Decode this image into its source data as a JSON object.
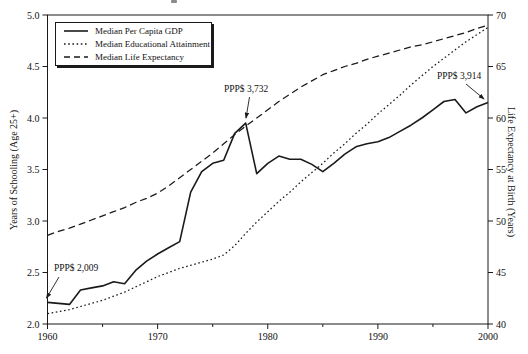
{
  "chart_data": {
    "type": "line",
    "title": "",
    "x": [
      1960,
      1961,
      1962,
      1963,
      1964,
      1965,
      1966,
      1967,
      1968,
      1969,
      1970,
      1971,
      1972,
      1973,
      1974,
      1975,
      1976,
      1977,
      1978,
      1979,
      1980,
      1981,
      1982,
      1983,
      1984,
      1985,
      1986,
      1987,
      1988,
      1989,
      1990,
      1991,
      1992,
      1993,
      1994,
      1995,
      1996,
      1997,
      1998,
      1999,
      2000
    ],
    "xlim": [
      1960,
      2000
    ],
    "ylim_left": [
      2.0,
      5.0
    ],
    "ylim_right": [
      40,
      70
    ],
    "ylabel_left": "Years of Schooling (Age 25+)",
    "ylabel_right": "Life Expectancy at Birth (Years)",
    "xlabel": "",
    "grid": false,
    "legend_position": "top-left",
    "xticks_major": [
      1960,
      1970,
      1980,
      1990,
      2000
    ],
    "xticks_minor": [
      1965,
      1975,
      1985,
      1995
    ],
    "yticks_left": [
      "2.0",
      "2.5",
      "3.0",
      "3.5",
      "4.0",
      "4.5",
      "5.0"
    ],
    "yticks_right": [
      "40",
      "45",
      "50",
      "55",
      "60",
      "65",
      "70"
    ],
    "series": [
      {
        "name": "Median Per Capita GDP",
        "axis": "left",
        "style": "solid",
        "values": [
          2.21,
          2.2,
          2.19,
          2.33,
          2.35,
          2.37,
          2.41,
          2.39,
          2.52,
          2.61,
          2.68,
          2.74,
          2.8,
          3.28,
          3.48,
          3.56,
          3.59,
          3.85,
          3.95,
          3.46,
          3.56,
          3.63,
          3.6,
          3.6,
          3.55,
          3.48,
          3.56,
          3.65,
          3.72,
          3.75,
          3.77,
          3.81,
          3.87,
          3.93,
          4.0,
          4.08,
          4.16,
          4.18,
          4.05,
          4.11,
          4.15
        ]
      },
      {
        "name": "Median Educational Attainment",
        "axis": "left",
        "style": "dotted",
        "values": [
          2.1,
          2.12,
          2.14,
          2.17,
          2.2,
          2.23,
          2.27,
          2.31,
          2.36,
          2.41,
          2.46,
          2.5,
          2.54,
          2.57,
          2.6,
          2.63,
          2.67,
          2.76,
          2.88,
          2.99,
          3.09,
          3.19,
          3.28,
          3.38,
          3.47,
          3.56,
          3.66,
          3.75,
          3.85,
          3.94,
          4.04,
          4.13,
          4.22,
          4.32,
          4.41,
          4.5,
          4.58,
          4.66,
          4.74,
          4.81,
          4.88
        ]
      },
      {
        "name": "Median Life Expectancy",
        "axis": "right",
        "style": "dashed",
        "values": [
          48.6,
          49.0,
          49.3,
          49.7,
          50.1,
          50.5,
          50.9,
          51.3,
          51.8,
          52.2,
          52.7,
          53.4,
          54.2,
          55.0,
          55.8,
          56.6,
          57.5,
          58.4,
          59.2,
          60.0,
          60.8,
          61.6,
          62.3,
          63.0,
          63.6,
          64.2,
          64.6,
          65.0,
          65.3,
          65.7,
          66.0,
          66.3,
          66.6,
          66.9,
          67.1,
          67.4,
          67.7,
          68.0,
          68.3,
          68.7,
          69.0
        ]
      }
    ],
    "annotations": [
      {
        "label": "PPP$ 2,009",
        "series": "Median Per Capita GDP",
        "year": 1960
      },
      {
        "label": "PPP$ 3,732",
        "series": "Median Per Capita GDP",
        "year": 1978
      },
      {
        "label": "PPP$ 3,914",
        "series": "Median Per Capita GDP",
        "year": 2000
      }
    ],
    "colors": {
      "line": "#1a1a1a",
      "text": "#111111",
      "background": "#ffffff"
    }
  },
  "legend": {
    "items": [
      {
        "label": "Median Per Capita GDP"
      },
      {
        "label": "Median Educational Attainment"
      },
      {
        "label": "Median Life Expectancy"
      }
    ]
  }
}
